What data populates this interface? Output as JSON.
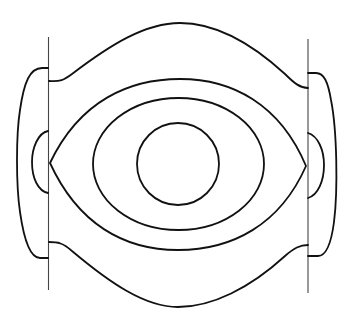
{
  "figure": {
    "background_color": "#ffffff",
    "stroke_color": "#111111",
    "width": 352,
    "height": 315
  },
  "elements": {
    "left_vertical_line": {
      "x": 48.5,
      "y1": 37,
      "y2": 290
    },
    "right_vertical_line": {
      "x": 308,
      "y1": 39,
      "y2": 293
    },
    "inner_circle": {
      "cx": 178,
      "cy": 164,
      "r": 41
    },
    "middle_ellipse": {
      "cx": 178.5,
      "cy": 164,
      "rx": 85.5,
      "ry": 66
    },
    "eye_shape": {
      "left_point": [
        50,
        163
      ],
      "right_point": [
        306,
        166
      ],
      "top_y": 79,
      "bottom_y": 250
    },
    "outer_top_curve": {
      "left_y": 81,
      "peak": [
        180,
        23
      ],
      "right_y": 88
    },
    "outer_bottom_curve": {
      "left_y": 242,
      "trough": [
        178,
        307
      ],
      "right_y": 245
    },
    "left_outer_lobe": {
      "top_y": 68,
      "bottom_y": 258,
      "extreme_x": 16
    },
    "left_inner_lobe": {
      "top_y": 131,
      "bottom_y": 193,
      "extreme_x": 32
    },
    "right_outer_lobe": {
      "top_y": 73,
      "bottom_y": 256,
      "extreme_x": 338
    },
    "right_inner_lobe": {
      "top_y": 133,
      "bottom_y": 198,
      "extreme_x": 324
    }
  }
}
